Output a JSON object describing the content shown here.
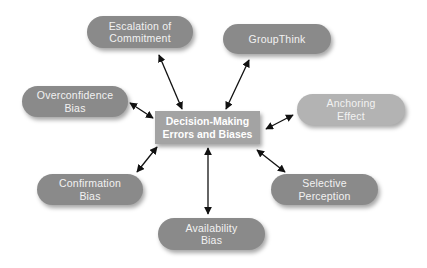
{
  "diagram": {
    "center": {
      "label": "Decision-Making\nErrors and Biases"
    },
    "nodes": [
      {
        "id": "escalation",
        "label": "Escalation of\nCommitment"
      },
      {
        "id": "groupthink",
        "label": "GroupThink"
      },
      {
        "id": "overconfidence",
        "label": "Overconfidence\nBias"
      },
      {
        "id": "anchoring",
        "label": "Anchoring\nEffect"
      },
      {
        "id": "confirmation",
        "label": "Confirmation\nBias"
      },
      {
        "id": "selective",
        "label": "Selective\nPerception"
      },
      {
        "id": "availability",
        "label": "Availability\nBias"
      }
    ],
    "edges": [
      {
        "from": "center",
        "to": "escalation",
        "type": "bidirectional"
      },
      {
        "from": "center",
        "to": "groupthink",
        "type": "bidirectional"
      },
      {
        "from": "center",
        "to": "overconfidence",
        "type": "bidirectional"
      },
      {
        "from": "center",
        "to": "anchoring",
        "type": "bidirectional"
      },
      {
        "from": "center",
        "to": "confirmation",
        "type": "bidirectional"
      },
      {
        "from": "center",
        "to": "selective",
        "type": "bidirectional"
      },
      {
        "from": "center",
        "to": "availability",
        "type": "bidirectional"
      }
    ],
    "colors": {
      "node_dark": "#8a8a8a",
      "node_light": "#b3b3b3",
      "center": "#a3a3a3",
      "text": "#f2f2f2",
      "arrow": "#111111"
    }
  }
}
